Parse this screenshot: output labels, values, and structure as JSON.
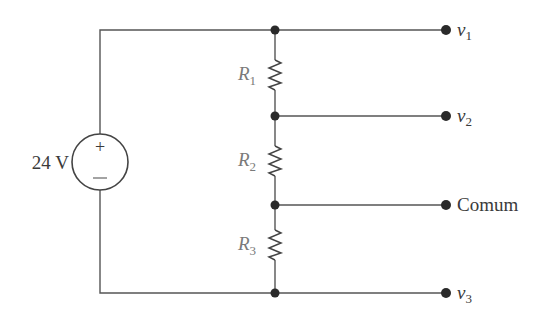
{
  "diagram": {
    "type": "voltage-divider-circuit",
    "source": {
      "label": "24 V",
      "plus_sign": "+",
      "minus_sign": "−"
    },
    "resistors": [
      {
        "name": "R",
        "sub": "1"
      },
      {
        "name": "R",
        "sub": "2"
      },
      {
        "name": "R",
        "sub": "3"
      }
    ],
    "terminals": [
      {
        "name": "v",
        "sub": "1"
      },
      {
        "name": "v",
        "sub": "2"
      },
      {
        "label": "Comum"
      },
      {
        "name": "v",
        "sub": "3"
      }
    ],
    "colors": {
      "wire": "#555555",
      "node": "#2a2a2a",
      "resistor_label": "#7a7a7a",
      "text": "#3a3a3a"
    }
  }
}
